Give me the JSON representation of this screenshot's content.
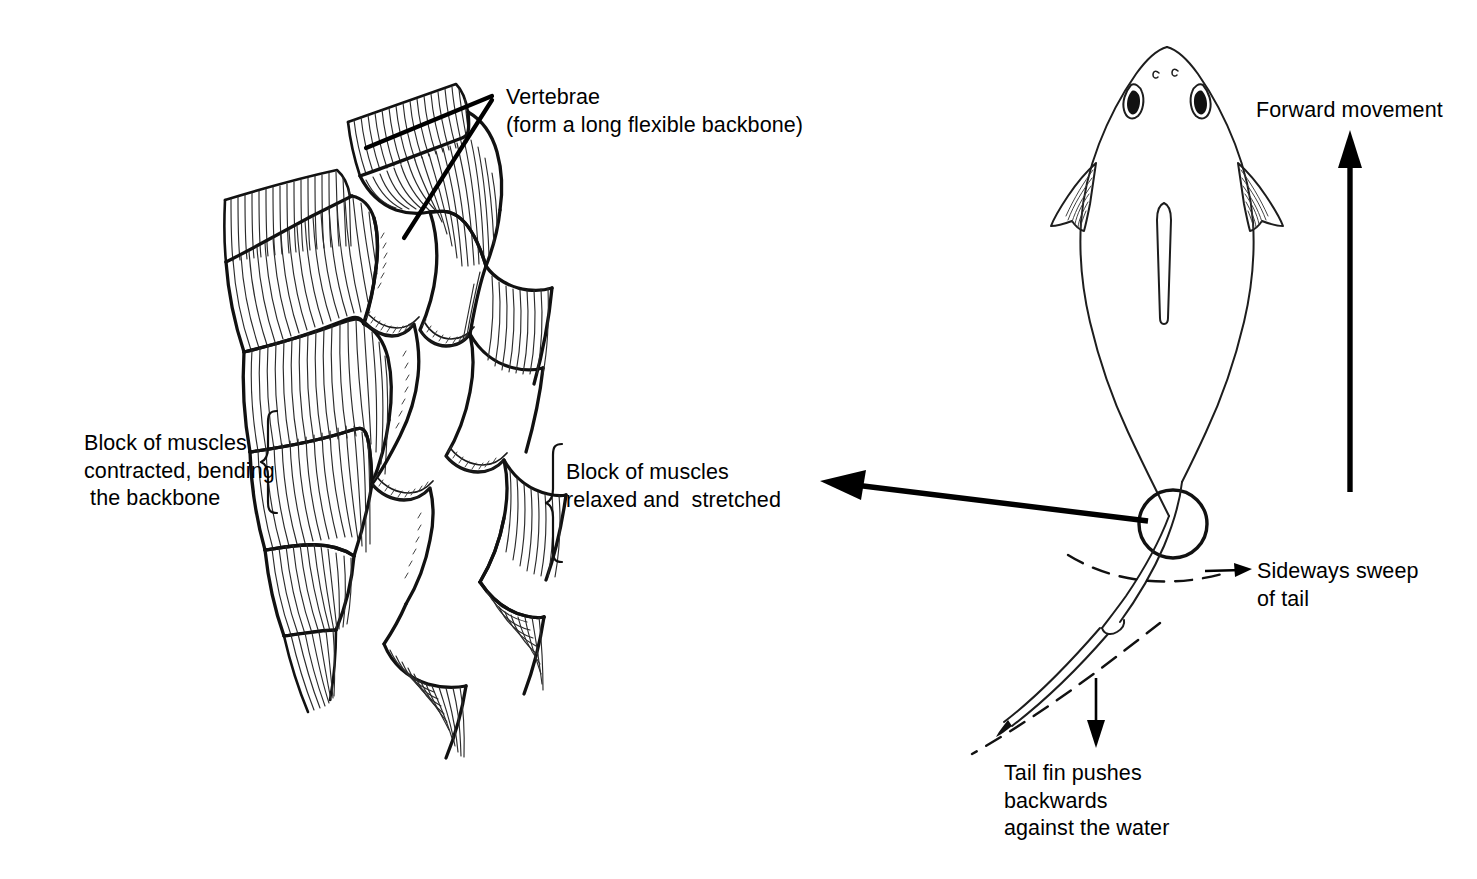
{
  "figure": {
    "background_color": "#ffffff",
    "ink_color": "#111111",
    "panels": [
      {
        "id": "muscle-panel",
        "name": "Block of muscles and backbone, dorsal view"
      },
      {
        "id": "fish-panel",
        "name": "Whole fish from above showing tail sweep"
      }
    ]
  },
  "labels": {
    "vertebrae": "Vertebrae\n(form a long flexible backbone)",
    "vertebrae_line1": "Vertebrae",
    "vertebrae_line2": "(form a long flexible backbone)",
    "muscles_contracted": "Block of muscles\ncontracted, bending\nthe backbone",
    "muscles_contracted_line1": "Block of muscles",
    "muscles_contracted_line2": "contracted, bending",
    "muscles_contracted_line3": " the backbone",
    "muscles_relaxed": "Block of muscles\nrelaxed and  stretched",
    "muscles_relaxed_line1": "Block of muscles",
    "muscles_relaxed_line2": "relaxed and  stretched",
    "forward_movement": "Forward movement",
    "sideways_sweep": "Sideways sweep\nof tail",
    "sideways_sweep_line1": "Sideways sweep",
    "sideways_sweep_line2": "of tail",
    "tail_fin_pushes": "Tail fin pushes\nbackwards\nagainst the water",
    "tail_fin_pushes_line1": "Tail fin pushes",
    "tail_fin_pushes_line2": "backwards",
    "tail_fin_pushes_line3": "against the water"
  },
  "annotations": {
    "forward_movement_arrow": {
      "direction": "up",
      "name": "forward-movement-arrow"
    },
    "thrust_arrow": {
      "direction": "left",
      "name": "thrust-arrow"
    },
    "sweep_arrow": {
      "direction": "right",
      "name": "sideways-sweep-arrow"
    },
    "backwards_push_arrow": {
      "direction": "down",
      "name": "tail-push-arrow"
    },
    "pointer_count": 2,
    "bracket_left": "contracted muscle block bracket",
    "bracket_right": "relaxed muscle block bracket",
    "tail_pivot_circle": "caudal peduncle pivot circle",
    "dashed_arcs": 2
  },
  "anatomy": {
    "muscle_blocks": 10,
    "vertebrae_joints": 4,
    "fish_parts": [
      "snout",
      "nostrils",
      "eyes",
      "pectoral fins",
      "dorsal fin",
      "caudal peduncle",
      "tail fin"
    ]
  }
}
